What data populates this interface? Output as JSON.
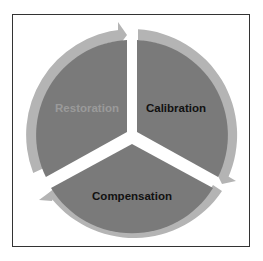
{
  "diagram": {
    "type": "cycle",
    "segments": [
      {
        "label": "Restoration",
        "text_color": "#9a9a9a",
        "fill": "#7a7a7a"
      },
      {
        "label": "Calibration",
        "text_color": "#111111",
        "fill": "#7a7a7a"
      },
      {
        "label": "Compensation",
        "text_color": "#111111",
        "fill": "#7a7a7a"
      }
    ],
    "ring_color": "#b4b4b4",
    "frame_color": "#333333",
    "direction": "clockwise"
  }
}
